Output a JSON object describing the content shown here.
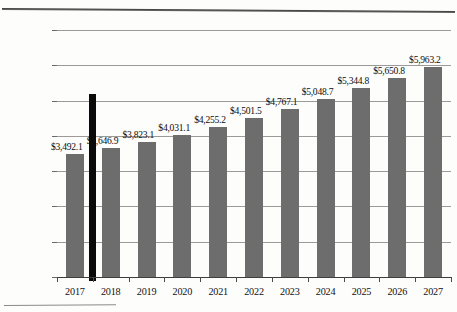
{
  "chart_data": {
    "type": "bar",
    "title": "",
    "xlabel": "",
    "ylabel": "",
    "categories": [
      "2017",
      "2018",
      "2019",
      "2020",
      "2021",
      "2022",
      "2023",
      "2024",
      "2025",
      "2026",
      "2027"
    ],
    "values": [
      3492.1,
      3646.9,
      3823.1,
      4031.1,
      4255.2,
      4501.5,
      4767.1,
      5048.7,
      5344.8,
      5650.8,
      5963.2
    ],
    "data_labels": [
      "$3,492.1",
      "$3,646.9",
      "$3,823.1",
      "$4,031.1",
      "$4,255.2",
      "$4,501.5",
      "$4,767.1",
      "$5,048.7",
      "$5,344.8",
      "$5,650.8",
      "$5,963.2"
    ],
    "ylim": [
      0,
      7000
    ],
    "ytick_values": [
      0,
      1000,
      2000,
      3000,
      4000,
      5000,
      6000,
      7000
    ],
    "ytick_labels": [
      "$0.0",
      "$1,000.0",
      "$2,000.0",
      "$3,000.0",
      "$4,000.0",
      "$5,000.0",
      "$6,000.0",
      "$7,000.0"
    ],
    "grid": true,
    "legend": "none",
    "series": [
      {
        "name": "Value",
        "color": "#6d6d6d",
        "values": [
          3492.1,
          3646.9,
          3823.1,
          4031.1,
          4255.2,
          4501.5,
          4767.1,
          5048.7,
          5344.8,
          5650.8,
          5963.2
        ]
      }
    ],
    "annotations": [
      {
        "name": "vertical-divider",
        "type": "vertical-line",
        "color": "#0a0a0a",
        "between_categories": [
          "2017",
          "2018"
        ],
        "value_top": 5200
      }
    ]
  },
  "colors": {
    "bar": "#6d6d6d",
    "divider": "#0a0a0a",
    "gridline": "#9a9a9a",
    "axis": "#3d3d3d",
    "text": "#111111",
    "background": "#fdfdfc"
  }
}
